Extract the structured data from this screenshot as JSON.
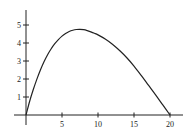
{
  "chart_data": {
    "type": "line",
    "title": "",
    "xlabel": "",
    "ylabel": "",
    "xlim": [
      0,
      21.5
    ],
    "ylim": [
      0,
      5.8
    ],
    "grid": false,
    "legend": null,
    "x_ticks": [
      5,
      10,
      15,
      20
    ],
    "x_tick_labels": [
      "5",
      "10",
      "15",
      "20"
    ],
    "y_ticks": [
      1,
      2,
      3,
      4,
      5
    ],
    "y_tick_labels": [
      "1",
      "2",
      "3",
      "4",
      "5"
    ],
    "series": [
      {
        "name": "curve",
        "color": "#222222",
        "x": [
          0,
          0.5,
          1,
          1.5,
          2,
          2.5,
          3,
          3.5,
          4,
          4.5,
          5,
          5.5,
          6,
          6.5,
          7,
          7.5,
          8,
          8.5,
          9,
          9.5,
          10,
          11,
          12,
          13,
          14,
          15,
          16,
          17,
          18,
          19,
          20
        ],
        "y": [
          0,
          0.75,
          1.4,
          1.98,
          2.5,
          2.96,
          3.35,
          3.68,
          3.96,
          4.19,
          4.38,
          4.53,
          4.64,
          4.71,
          4.75,
          4.76,
          4.74,
          4.69,
          4.62,
          4.54,
          4.45,
          4.22,
          3.93,
          3.58,
          3.18,
          2.72,
          2.2,
          1.66,
          1.12,
          0.56,
          0
        ]
      }
    ]
  }
}
